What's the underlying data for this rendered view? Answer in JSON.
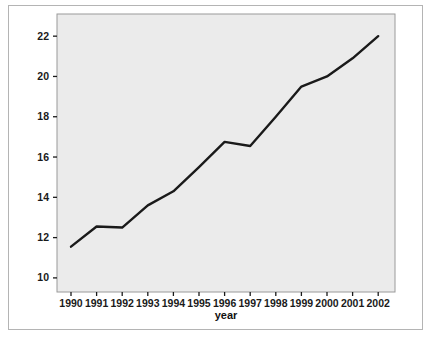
{
  "figure": {
    "background_color": "#ffffff",
    "frame_color": "#b4b4b4",
    "plot_background_color": "#ebebeb",
    "plot_border_color": "#9a9a9a",
    "line_color": "#1a1a1a"
  },
  "chart_data": {
    "type": "line",
    "title": "",
    "subtitle": "",
    "xlabel": "year",
    "ylabel": "",
    "categories": [
      "1990",
      "1991",
      "1992",
      "1993",
      "1994",
      "1995",
      "1996",
      "1997",
      "1998",
      "1999",
      "2000",
      "2001",
      "2002"
    ],
    "x": [
      1990,
      1991,
      1992,
      1993,
      1994,
      1995,
      1996,
      1997,
      1998,
      1999,
      2000,
      2001,
      2002
    ],
    "values": [
      11.55,
      12.55,
      12.5,
      13.6,
      14.3,
      15.5,
      16.75,
      16.55,
      18.0,
      19.5,
      20.0,
      20.9,
      22.0
    ],
    "series": [
      {
        "name": "",
        "values": [
          11.55,
          12.55,
          12.5,
          13.6,
          14.3,
          15.5,
          16.75,
          16.55,
          18.0,
          19.5,
          20.0,
          20.9,
          22.0
        ]
      }
    ],
    "xtick_labels": [
      "1990",
      "1991",
      "1992",
      "1993",
      "1994",
      "1995",
      "1996",
      "1997",
      "1998",
      "1999",
      "2000",
      "2001",
      "2002"
    ],
    "ytick_labels": [
      "10",
      "12",
      "14",
      "16",
      "18",
      "20",
      "22"
    ],
    "yticks": [
      10,
      12,
      14,
      16,
      18,
      20,
      22
    ],
    "xlim": [
      1989.45,
      1002.0
    ],
    "ylim": [
      9.3,
      23.1
    ],
    "grid": false,
    "legend": null,
    "legend_position": "none",
    "annotations": []
  },
  "axis": {
    "x_title": "year",
    "y_ticks": [
      {
        "label": "22"
      },
      {
        "label": "20"
      },
      {
        "label": "18"
      },
      {
        "label": "16"
      },
      {
        "label": "14"
      },
      {
        "label": "12"
      },
      {
        "label": "10"
      }
    ],
    "x_ticks": [
      {
        "label": "1990"
      },
      {
        "label": "1991"
      },
      {
        "label": "1992"
      },
      {
        "label": "1993"
      },
      {
        "label": "1994"
      },
      {
        "label": "1995"
      },
      {
        "label": "1996"
      },
      {
        "label": "1997"
      },
      {
        "label": "1998"
      },
      {
        "label": "1999"
      },
      {
        "label": "2000"
      },
      {
        "label": "2001"
      },
      {
        "label": "2002"
      }
    ]
  }
}
